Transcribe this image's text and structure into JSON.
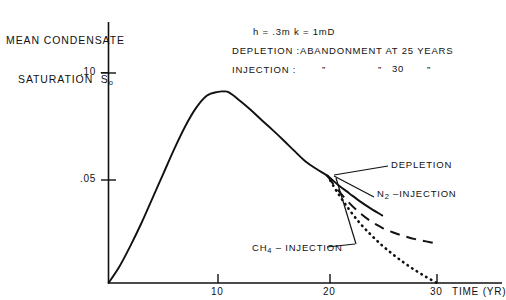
{
  "chart_data": {
    "type": "line",
    "title": "",
    "xlabel": "TIME (YR)",
    "ylabel_line1": "MEAN CONDENSATE",
    "ylabel_line2": "SATURATION",
    "ylabel_symbol": "S",
    "ylabel_symbol_sub": "o",
    "xlim": [
      0,
      30
    ],
    "ylim": [
      0,
      0.115
    ],
    "xticks": [
      10,
      20,
      30
    ],
    "xticklabels": [
      "10",
      "20",
      "30"
    ],
    "yticks": [
      0.05,
      0.1
    ],
    "yticklabels": [
      ".05",
      ".10"
    ],
    "grid": false,
    "legend_position": "inline-annotations",
    "annotations": [
      "h = .3m k = 1mD",
      "DEPLETION : ABANDONMENT AT 25 YEARS",
      "INJECTION :          \"           \" 30  \""
    ],
    "annotation_lines": {
      "conditions": "h = .3m k = 1mD",
      "depletion_label": "DEPLETION :",
      "depletion_text": "ABANDONMENT AT 25 YEARS",
      "injection_label": "INJECTION :",
      "injection_ditto1": "”",
      "injection_ditto2": "”",
      "injection_years": "30",
      "injection_ditto3": "”"
    },
    "series": [
      {
        "name": "DEPLETION",
        "style": "solid",
        "label": "DEPLETION",
        "x": [
          0,
          1,
          2,
          3,
          4,
          5,
          6,
          7,
          8,
          9,
          10,
          10.5,
          11,
          12,
          13,
          14,
          15,
          16,
          17,
          18,
          19,
          20,
          21,
          22,
          23,
          24,
          25
        ],
        "y": [
          0.0,
          0.008,
          0.018,
          0.029,
          0.041,
          0.053,
          0.065,
          0.076,
          0.085,
          0.091,
          0.0928,
          0.093,
          0.0925,
          0.0885,
          0.084,
          0.079,
          0.0742,
          0.0692,
          0.064,
          0.059,
          0.0553,
          0.052,
          0.0475,
          0.0435,
          0.0395,
          0.036,
          0.0328
        ]
      },
      {
        "name": "N2-INJECTION",
        "style": "dashed",
        "label_main": "N",
        "label_sub": "2",
        "label_rest": " –INJECTION",
        "label": "N2 –INJECTION",
        "x": [
          20,
          21,
          22,
          23,
          24,
          25,
          26,
          27,
          28,
          29,
          30
        ],
        "y": [
          0.052,
          0.0448,
          0.0388,
          0.0338,
          0.0298,
          0.0268,
          0.0245,
          0.0228,
          0.0213,
          0.0202,
          0.0192
        ]
      },
      {
        "name": "CH4-INJECTION",
        "style": "dotted",
        "label_main": "CH",
        "label_sub": "4",
        "label_rest": " – INJECTION",
        "label": "CH4 – INJECTION",
        "x": [
          20,
          21,
          22,
          23,
          24,
          25,
          26,
          27,
          28,
          29,
          30
        ],
        "y": [
          0.052,
          0.0432,
          0.0355,
          0.0288,
          0.0232,
          0.0182,
          0.0138,
          0.0098,
          0.0062,
          0.003,
          0.0
        ]
      }
    ],
    "branch_point": {
      "x": 20,
      "y": 0.052
    },
    "peak_point": {
      "x": 10.5,
      "y": 0.093
    },
    "colors": {
      "ink": "#111111",
      "background": "#ffffff"
    }
  }
}
